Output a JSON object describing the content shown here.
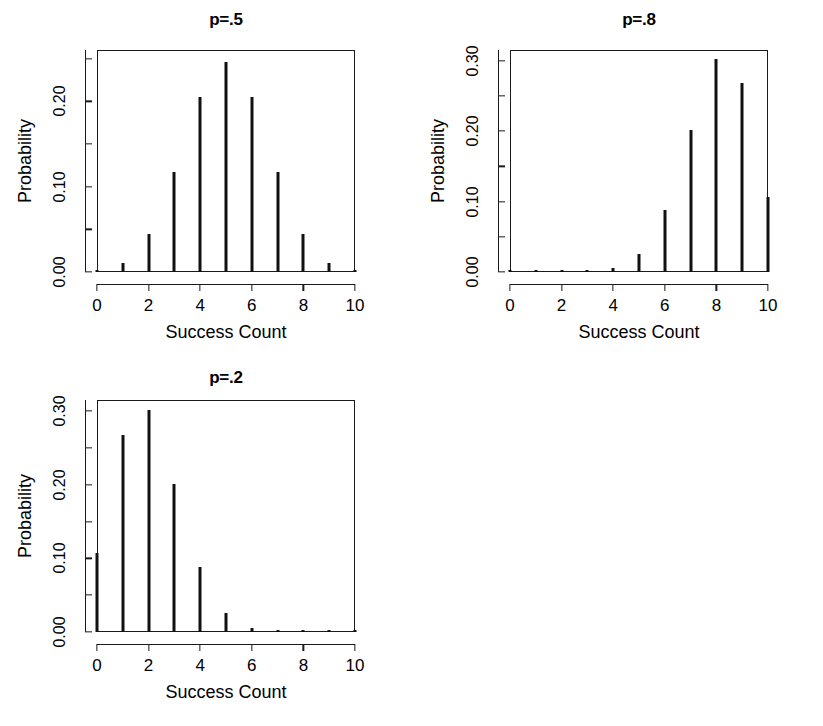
{
  "figure": {
    "background_color": "#ffffff",
    "line_color": "#111111",
    "panel_count": 3,
    "caption_fragment": ""
  },
  "chart_data": [
    {
      "type": "bar",
      "title": "p=.5",
      "xlabel": "Success Count",
      "ylabel": "Probability",
      "categories": [
        "0",
        "1",
        "2",
        "3",
        "4",
        "5",
        "6",
        "7",
        "8",
        "9",
        "10"
      ],
      "x": [
        0,
        1,
        2,
        3,
        4,
        5,
        6,
        7,
        8,
        9,
        10
      ],
      "values": [
        0.001,
        0.01,
        0.044,
        0.117,
        0.205,
        0.246,
        0.205,
        0.117,
        0.044,
        0.01,
        0.001
      ],
      "xlim": [
        0,
        10
      ],
      "ylim": [
        0,
        0.26
      ],
      "ytick_labels": [
        "0.00",
        "0.10",
        "0.20"
      ],
      "ytick_values": [
        0.0,
        0.1,
        0.2
      ],
      "yminor_values": [
        0.05,
        0.15,
        0.25
      ],
      "xtick_labels": [
        "0",
        "2",
        "4",
        "6",
        "8",
        "10"
      ],
      "xtick_values": [
        0,
        2,
        4,
        6,
        8,
        10
      ],
      "grid": false,
      "legend": false
    },
    {
      "type": "bar",
      "title": "p=.8",
      "xlabel": "Success Count",
      "ylabel": "Probability",
      "categories": [
        "0",
        "1",
        "2",
        "3",
        "4",
        "5",
        "6",
        "7",
        "8",
        "9",
        "10"
      ],
      "x": [
        0,
        1,
        2,
        3,
        4,
        5,
        6,
        7,
        8,
        9,
        10
      ],
      "values": [
        0.0,
        0.0,
        0.0,
        0.001,
        0.006,
        0.026,
        0.088,
        0.201,
        0.302,
        0.268,
        0.107
      ],
      "xlim": [
        0,
        10
      ],
      "ylim": [
        0,
        0.315
      ],
      "ytick_labels": [
        "0.00",
        "0.10",
        "0.20",
        "0.30"
      ],
      "ytick_values": [
        0.0,
        0.1,
        0.2,
        0.3
      ],
      "yminor_values": [
        0.05,
        0.15,
        0.25
      ],
      "xtick_labels": [
        "0",
        "2",
        "4",
        "6",
        "8",
        "10"
      ],
      "xtick_values": [
        0,
        2,
        4,
        6,
        8,
        10
      ],
      "grid": false,
      "legend": false
    },
    {
      "type": "bar",
      "title": "p=.2",
      "xlabel": "Success Count",
      "ylabel": "Probability",
      "categories": [
        "0",
        "1",
        "2",
        "3",
        "4",
        "5",
        "6",
        "7",
        "8",
        "9",
        "10"
      ],
      "x": [
        0,
        1,
        2,
        3,
        4,
        5,
        6,
        7,
        8,
        9,
        10
      ],
      "values": [
        0.107,
        0.268,
        0.302,
        0.201,
        0.088,
        0.026,
        0.006,
        0.001,
        0.0,
        0.0,
        0.0
      ],
      "xlim": [
        0,
        10
      ],
      "ylim": [
        0,
        0.315
      ],
      "ytick_labels": [
        "0.00",
        "0.10",
        "0.20",
        "0.30"
      ],
      "ytick_values": [
        0.0,
        0.1,
        0.2,
        0.3
      ],
      "yminor_values": [
        0.05,
        0.15,
        0.25
      ],
      "xtick_labels": [
        "0",
        "2",
        "4",
        "6",
        "8",
        "10"
      ],
      "xtick_values": [
        0,
        2,
        4,
        6,
        8,
        10
      ],
      "grid": false,
      "legend": false
    }
  ],
  "panel_geometry": [
    {
      "left": 97,
      "top": 50,
      "width": 258,
      "height": 222,
      "title_top": 10,
      "title_left": 97,
      "title_width": 258
    },
    {
      "left": 510,
      "top": 50,
      "width": 258,
      "height": 222,
      "title_top": 10,
      "title_left": 510,
      "title_width": 258
    },
    {
      "left": 97,
      "top": 400,
      "width": 258,
      "height": 232,
      "title_top": 368,
      "title_left": 97,
      "title_width": 258
    }
  ]
}
